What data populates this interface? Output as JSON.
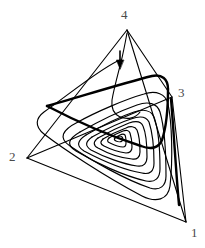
{
  "figure": {
    "title": "",
    "background_color": "#ffffff",
    "line_color": "#000000",
    "label_color": "#4a4a4a",
    "width": 205,
    "height": 248
  },
  "chart_data": {
    "type": "line",
    "title": "",
    "subtitle": "",
    "xlabel": "",
    "ylabel": "",
    "grid": false,
    "legend": null,
    "axes": "none",
    "simplex": {
      "shape": "tetrahedron",
      "dimension": 3,
      "vertex_labels": [
        "1",
        "2",
        "3",
        "4"
      ],
      "vertices": [
        {
          "label": "1",
          "x": 186,
          "y": 222
        },
        {
          "label": "2",
          "x": 27,
          "y": 158
        },
        {
          "label": "3",
          "x": 172,
          "y": 97
        },
        {
          "label": "4",
          "x": 127,
          "y": 30
        }
      ],
      "edges": [
        [
          "2",
          "4"
        ],
        [
          "4",
          "3"
        ],
        [
          "4",
          "1"
        ],
        [
          "2",
          "1"
        ],
        [
          "2",
          "3"
        ],
        [
          "3",
          "1"
        ]
      ]
    },
    "trajectory": {
      "style": "spiral",
      "direction": "inward",
      "turns": 7,
      "focus": {
        "x": 125,
        "y": 133
      },
      "start_near_vertex": "4",
      "line_width": 1.15,
      "emphasis_line_width": 2.4
    },
    "annotations": [
      {
        "type": "arrow",
        "name": "flow-direction-arrow",
        "x": 120,
        "y": 52,
        "dx": 0,
        "dy": 14,
        "label": ""
      }
    ]
  },
  "labels": {
    "v1": "1",
    "v2": "2",
    "v3": "3",
    "v4": "4"
  }
}
